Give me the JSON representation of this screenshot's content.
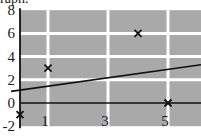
{
  "caption": "raph.",
  "chart_data": {
    "type": "scatter",
    "title": "",
    "xlabel": "",
    "ylabel": "",
    "xlim": [
      -0.1,
      6
    ],
    "ylim": [
      -2,
      8
    ],
    "grid": true,
    "background": "#a9a9a9",
    "grid_color": "#ffffff",
    "x_ticks": [
      "1",
      "3",
      "5"
    ],
    "x_tick_values": [
      1,
      3,
      5
    ],
    "y_ticks": [
      "8",
      "6",
      "4",
      "2",
      "0",
      "-2"
    ],
    "y_tick_values": [
      8,
      6,
      4,
      2,
      0,
      -2
    ],
    "series": [
      {
        "name": "points",
        "marker": "x",
        "points": [
          {
            "x": 0,
            "y": -1
          },
          {
            "x": 1,
            "y": 3
          },
          {
            "x": 4,
            "y": 6
          },
          {
            "x": 5,
            "y": 0
          }
        ]
      },
      {
        "name": "fit line",
        "type": "line",
        "points": [
          {
            "x": -0.1,
            "y": 1
          },
          {
            "x": 6,
            "y": 3.3
          }
        ]
      }
    ]
  }
}
